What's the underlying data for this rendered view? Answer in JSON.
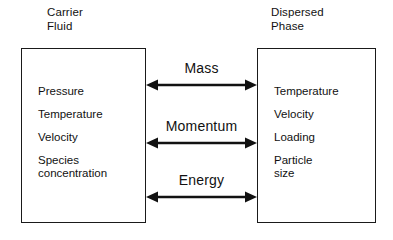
{
  "diagram": {
    "title_note": "Carrier fluid / dispersed phase coupling diagram",
    "phases": [
      {
        "id": "carrier-fluid",
        "title": "Carrier\nFluid",
        "properties": [
          "Pressure",
          "Temperature",
          "Velocity",
          "Species\nconcentration"
        ]
      },
      {
        "id": "dispersed-phase",
        "title": "Dispersed\nPhase",
        "properties": [
          "Temperature",
          "Velocity",
          "Loading",
          "Particle\nsize"
        ]
      }
    ],
    "transfers": [
      {
        "id": "mass",
        "label": "Mass",
        "direction": "bidirectional"
      },
      {
        "id": "momentum",
        "label": "Momentum",
        "direction": "bidirectional"
      },
      {
        "id": "energy",
        "label": "Energy",
        "direction": "bidirectional"
      }
    ],
    "colors": {
      "background": "#ffffff",
      "stroke": "#1a1a1a",
      "text": "#111111"
    }
  }
}
